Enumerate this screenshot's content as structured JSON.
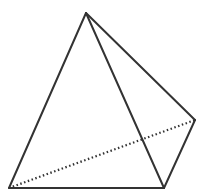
{
  "diagram": {
    "type": "pyramid",
    "stroke_color": "#333333",
    "background": "#ffffff",
    "vertices": {
      "apex": [
        86,
        13
      ],
      "bottom_left": [
        9,
        188
      ],
      "bottom_right": [
        164,
        188
      ],
      "right": [
        195,
        120
      ]
    },
    "edges": [
      {
        "from": "apex",
        "to": "bottom_left",
        "style": "solid"
      },
      {
        "from": "apex",
        "to": "bottom_right",
        "style": "solid"
      },
      {
        "from": "apex",
        "to": "right",
        "style": "solid"
      },
      {
        "from": "bottom_left",
        "to": "bottom_right",
        "style": "solid"
      },
      {
        "from": "bottom_right",
        "to": "right",
        "style": "solid"
      },
      {
        "from": "bottom_left",
        "to": "right",
        "style": "dotted"
      }
    ]
  }
}
